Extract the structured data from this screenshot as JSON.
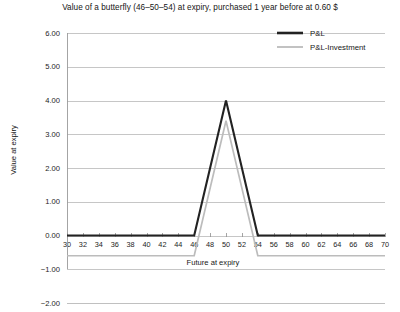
{
  "chart_data": {
    "type": "line",
    "title": "Value of a butterfly (46–50–54) at expiry, purchased 1 year before at 0.60 $",
    "xlabel": "Future at expiry",
    "ylabel": "Value at expiry",
    "xlim": [
      30,
      70
    ],
    "ylim": [
      -2.0,
      6.0
    ],
    "grid": true,
    "legend_position": "top-right",
    "xticks": [
      30,
      32,
      34,
      36,
      38,
      40,
      42,
      44,
      46,
      48,
      50,
      52,
      54,
      56,
      58,
      60,
      62,
      64,
      66,
      68,
      70
    ],
    "xtick_labels": [
      "30",
      "32",
      "34",
      "36",
      "38",
      "40",
      "42",
      "44",
      "46",
      "48",
      "50",
      "52",
      "54",
      "56",
      "58",
      "60",
      "62",
      "64",
      "66",
      "68",
      "70"
    ],
    "yticks": [
      6.0,
      5.0,
      4.0,
      3.0,
      2.0,
      1.0,
      0.0,
      -1.0,
      -2.0
    ],
    "ytick_labels": [
      "6.00",
      "5.00",
      "4.00",
      "3.00",
      "2.00",
      "1.00",
      "0.00",
      "−1.00",
      "−2.00"
    ],
    "series": [
      {
        "name": "P&L",
        "color": "#222222",
        "x": [
          30,
          46,
          50,
          54,
          70
        ],
        "values": [
          0.0,
          0.0,
          4.0,
          0.0,
          0.0
        ]
      },
      {
        "name": "P&L-Investment",
        "color": "#bcbcbc",
        "x": [
          30,
          46,
          50,
          54,
          70
        ],
        "values": [
          -0.6,
          -0.6,
          3.4,
          -0.6,
          -0.6
        ]
      }
    ]
  },
  "legend": {
    "entries": [
      {
        "label": "P&L",
        "color": "#222222"
      },
      {
        "label": "P&L-Investment",
        "color": "#bcbcbc"
      }
    ]
  },
  "colors": {
    "pl": "#222222",
    "investment": "#bcbcbc",
    "grid": "#b8b8b8",
    "axis": "#9a9a9a",
    "text": "#161616",
    "background": "#ffffff"
  }
}
